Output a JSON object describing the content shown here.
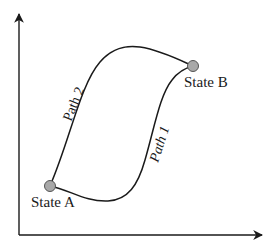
{
  "diagram": {
    "type": "state-paths",
    "axes": {
      "x_label": "",
      "y_label": ""
    },
    "states": [
      {
        "id": "A",
        "label": "State A",
        "color": "#a8a8a8"
      },
      {
        "id": "B",
        "label": "State B",
        "color": "#a8a8a8"
      }
    ],
    "paths": [
      {
        "id": "path1",
        "label": "Path 1",
        "from": "A",
        "to": "B"
      },
      {
        "id": "path2",
        "label": "Path 2",
        "from": "A",
        "to": "B"
      }
    ],
    "colors": {
      "line": "#1a1a1a",
      "node_fill": "#a8a8a8",
      "node_stroke": "#555555",
      "background": "#ffffff"
    }
  }
}
